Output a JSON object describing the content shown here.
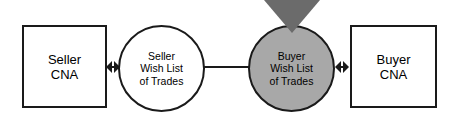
{
  "diagram": {
    "background_color": "#ffffff",
    "line_color": "#1a1a1a",
    "nodes": {
      "seller_cna": {
        "label": "Seller\nCNA",
        "shape": "rectangle",
        "fill": "#ffffff"
      },
      "seller_wish_list": {
        "shape": "circle",
        "fill": "#ffffff",
        "lines": [
          "Seller",
          "Wish List",
          "of Trades"
        ]
      },
      "buyer_wish_list": {
        "shape": "circle",
        "fill": "#a8a8a8",
        "lines": [
          "Buyer",
          "Wish List",
          "of Trades"
        ]
      },
      "buyer_cna": {
        "label": "Buyer\nCNA",
        "shape": "rectangle",
        "fill": "#ffffff"
      }
    },
    "markers": {
      "down_triangle": {
        "fill": "#6b6b6b",
        "direction": "down"
      }
    },
    "connectors": {
      "seller_cna_to_seller_wish": "double-headed-arrow",
      "seller_wish_to_buyer_wish": "plain-line",
      "buyer_wish_to_buyer_cna": "double-headed-arrow"
    }
  }
}
